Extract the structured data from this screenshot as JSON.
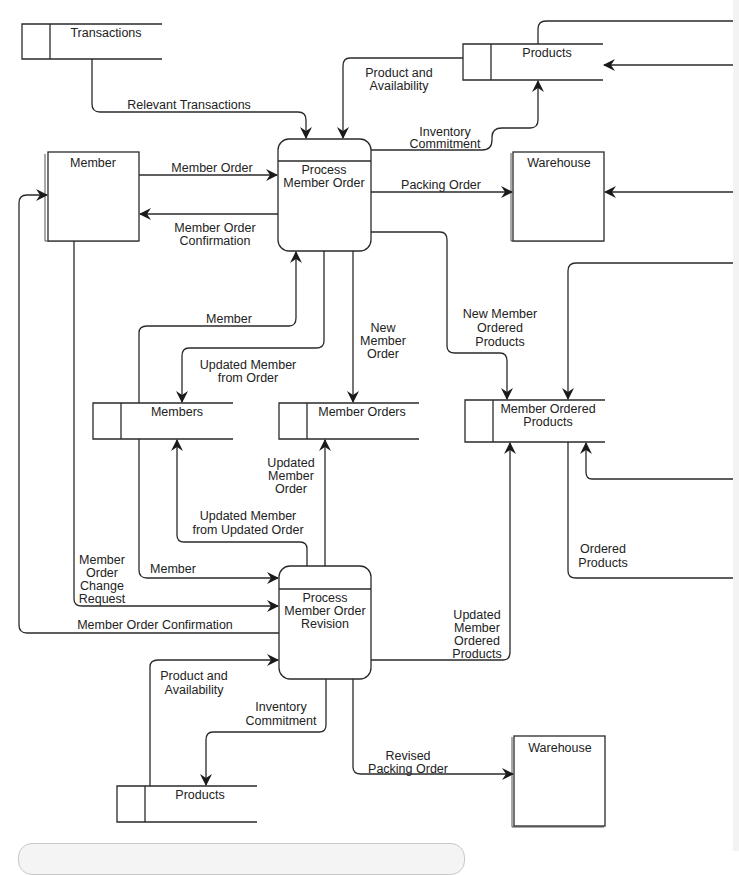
{
  "diagram": {
    "type": "data-flow-diagram",
    "external_entities": [
      {
        "id": "member",
        "label": "Member"
      },
      {
        "id": "warehouse_top",
        "label": "Warehouse"
      },
      {
        "id": "warehouse_bottom",
        "label": "Warehouse"
      }
    ],
    "processes": [
      {
        "id": "p1",
        "line1": "Process",
        "line2": "Member Order"
      },
      {
        "id": "p2",
        "line1": "Process",
        "line2": "Member Order",
        "line3": "Revision"
      }
    ],
    "data_stores": [
      {
        "id": "transactions",
        "label": "Transactions"
      },
      {
        "id": "products_top",
        "label": "Products"
      },
      {
        "id": "members",
        "label": "Members"
      },
      {
        "id": "member_orders",
        "label": "Member Orders"
      },
      {
        "id": "member_ordered_products",
        "line1": "Member Ordered",
        "line2": "Products"
      },
      {
        "id": "products_bottom",
        "label": "Products"
      }
    ],
    "flows": {
      "relevant_transactions": "Relevant Transactions",
      "product_availability_top": [
        "Product and",
        "Availability"
      ],
      "inventory_commitment_top": [
        "Inventory",
        "Commitment"
      ],
      "member_order": "Member Order",
      "member_order_confirmation_top": [
        "Member Order",
        "Confirmation"
      ],
      "packing_order": "Packing Order",
      "member_to_p1": "Member",
      "updated_member_from_order": [
        "Updated Member",
        "from Order"
      ],
      "new_member_order": [
        "New",
        "Member",
        "Order"
      ],
      "new_member_ordered_products": [
        "New Member",
        "Ordered",
        "Products"
      ],
      "updated_member_order": [
        "Updated",
        "Member",
        "Order"
      ],
      "updated_member_from_updated_order": [
        "Updated Member",
        "from Updated Order"
      ],
      "member_to_p2": "Member",
      "member_order_change_request": [
        "Member",
        "Order",
        "Change",
        "Request"
      ],
      "member_order_confirmation_bottom": "Member Order Confirmation",
      "updated_member_ordered_products": [
        "Updated",
        "Member",
        "Ordered",
        "Products"
      ],
      "ordered_products": [
        "Ordered",
        "Products"
      ],
      "product_availability_bottom": [
        "Product and",
        "Availability"
      ],
      "inventory_commitment_bottom": [
        "Inventory",
        "Commitment"
      ],
      "revised_packing_order": [
        "Revised",
        "Packing Order"
      ]
    }
  }
}
